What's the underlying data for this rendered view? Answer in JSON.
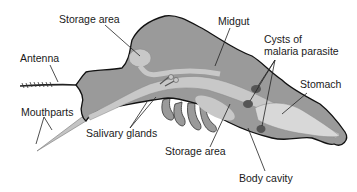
{
  "diagram": {
    "labels": {
      "storage_area_top": "Storage area",
      "midgut": "Midgut",
      "cysts_line1": "Cysts of",
      "cysts_line2": "malaria parasite",
      "antenna": "Antenna",
      "stomach": "Stomach",
      "mouthparts": "Mouthparts",
      "salivary_glands": "Salivary glands",
      "storage_area_bottom": "Storage area",
      "body_cavity": "Body cavity"
    },
    "colors": {
      "body_fill": "#9a9a9a",
      "inner_light": "#c8c8c8",
      "stomach_fill": "#d8d8d8",
      "cyst_fill": "#555555",
      "outline": "#111111",
      "leader_line": "#222222"
    }
  }
}
